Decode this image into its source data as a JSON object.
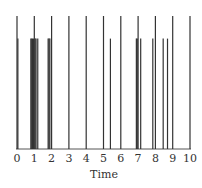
{
  "chart_data": {
    "type": "bar",
    "subtype": "event-raster / spike plot",
    "title": "",
    "xlabel": "Time",
    "ylabel": "",
    "xlim": [
      0,
      10
    ],
    "grid": false,
    "legend": null,
    "x_ticks": [
      "0",
      "1",
      "2",
      "3",
      "4",
      "5",
      "6",
      "7",
      "8",
      "9",
      "10"
    ],
    "series": [
      {
        "name": "tall events (integer times)",
        "height": 1.0,
        "x": [
          0,
          1,
          2,
          3,
          4,
          5,
          6,
          7,
          8,
          9,
          10
        ]
      },
      {
        "name": "short events",
        "height": 0.83,
        "x": [
          0.05,
          0.8,
          0.85,
          0.9,
          0.95,
          1.05,
          1.1,
          1.2,
          1.8,
          1.85,
          1.9,
          5.4,
          6.9,
          6.95,
          7.15,
          7.85,
          8.45,
          8.7
        ]
      }
    ],
    "colors": {
      "line": "#333333",
      "axis": "#555555"
    }
  }
}
